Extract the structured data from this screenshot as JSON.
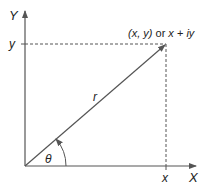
{
  "diagram": {
    "type": "complex-plane-polar-representation",
    "axes": {
      "x_label": "X",
      "y_label": "Y"
    },
    "point_label": "(x, y) or x + iy",
    "coordinate_labels": {
      "x": "x",
      "y": "y"
    },
    "radius_label": "r",
    "angle_label": "θ",
    "colors": {
      "line": "#555555",
      "text": "#222222",
      "background": "#ffffff"
    }
  }
}
